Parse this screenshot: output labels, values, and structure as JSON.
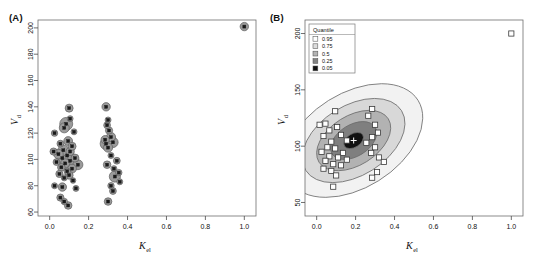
{
  "figure": {
    "panels": [
      {
        "id": "A",
        "label": "(A)",
        "xlabel_main": "K",
        "xlabel_sub": "el",
        "ylabel_main": "V",
        "ylabel_sub": "d",
        "xticks": [
          "0.0",
          "0.2",
          "0.4",
          "0.6",
          "0.8",
          "1.0"
        ],
        "yticks": [
          "60",
          "80",
          "100",
          "120",
          "140",
          "160",
          "180",
          "200"
        ]
      },
      {
        "id": "B",
        "label": "(B)",
        "xlabel_main": "K",
        "xlabel_sub": "el",
        "ylabel_main": "V",
        "ylabel_sub": "d",
        "xticks": [
          "0.0",
          "0.2",
          "0.4",
          "0.6",
          "0.8",
          "1.0"
        ],
        "yticks": [
          "50",
          "100",
          "150",
          "200"
        ],
        "legend": {
          "title": "Quantile",
          "items": [
            {
              "label": "0.95",
              "color": "#ffffff"
            },
            {
              "label": "0.75",
              "color": "#dcdcdc"
            },
            {
              "label": "0.5",
              "color": "#b4b4b4"
            },
            {
              "label": "0.25",
              "color": "#828282"
            },
            {
              "label": "0.05",
              "color": "#111111"
            }
          ]
        }
      }
    ]
  },
  "chart_data": [
    {
      "type": "scatter",
      "panel": "A",
      "title": "(A)",
      "xlabel": "K_el",
      "ylabel": "V_d",
      "xlim": [
        -0.06,
        1.06
      ],
      "ylim": [
        57,
        206
      ],
      "xticks": [
        0.0,
        0.2,
        0.4,
        0.6,
        0.8,
        1.0
      ],
      "yticks": [
        60,
        80,
        100,
        120,
        140,
        160,
        180,
        200
      ],
      "grid": false,
      "marker_note": "gray bubbles sized by weight, with small black squares at point centers",
      "points": [
        {
          "x": 0.1,
          "y": 139,
          "r": 4.0
        },
        {
          "x": 0.29,
          "y": 140,
          "r": 4.2
        },
        {
          "x": 0.105,
          "y": 131,
          "r": 3.0
        },
        {
          "x": 0.3,
          "y": 130,
          "r": 3.0
        },
        {
          "x": 0.085,
          "y": 127,
          "r": 6.5
        },
        {
          "x": 0.295,
          "y": 126,
          "r": 3.4
        },
        {
          "x": 0.075,
          "y": 124,
          "r": 5.0
        },
        {
          "x": 0.305,
          "y": 122,
          "r": 3.6
        },
        {
          "x": 0.025,
          "y": 120,
          "r": 3.2
        },
        {
          "x": 0.125,
          "y": 121,
          "r": 3.0
        },
        {
          "x": 0.315,
          "y": 117,
          "r": 4.6
        },
        {
          "x": 0.285,
          "y": 115,
          "r": 4.2
        },
        {
          "x": 0.095,
          "y": 114,
          "r": 4.4
        },
        {
          "x": 0.325,
          "y": 113,
          "r": 5.2
        },
        {
          "x": 0.055,
          "y": 112,
          "r": 3.4
        },
        {
          "x": 0.29,
          "y": 112,
          "r": 6.0
        },
        {
          "x": 0.115,
          "y": 110,
          "r": 4.0
        },
        {
          "x": 0.3,
          "y": 109,
          "r": 4.6
        },
        {
          "x": 0.02,
          "y": 106,
          "r": 3.6
        },
        {
          "x": 0.07,
          "y": 107,
          "r": 5.4
        },
        {
          "x": 0.105,
          "y": 106,
          "r": 4.2
        },
        {
          "x": 0.045,
          "y": 104,
          "r": 4.8
        },
        {
          "x": 0.09,
          "y": 103,
          "r": 6.8
        },
        {
          "x": 0.065,
          "y": 101,
          "r": 5.6
        },
        {
          "x": 0.13,
          "y": 101,
          "r": 4.0
        },
        {
          "x": 0.105,
          "y": 99,
          "r": 5.8
        },
        {
          "x": 0.035,
          "y": 98,
          "r": 3.4
        },
        {
          "x": 0.08,
          "y": 97,
          "r": 4.6
        },
        {
          "x": 0.145,
          "y": 96,
          "r": 5.0
        },
        {
          "x": 0.06,
          "y": 94,
          "r": 3.8
        },
        {
          "x": 0.115,
          "y": 93,
          "r": 4.4
        },
        {
          "x": 0.09,
          "y": 91,
          "r": 3.2
        },
        {
          "x": 0.05,
          "y": 89,
          "r": 3.6
        },
        {
          "x": 0.1,
          "y": 88,
          "r": 4.0
        },
        {
          "x": 0.075,
          "y": 86,
          "r": 3.0
        },
        {
          "x": 0.12,
          "y": 84,
          "r": 2.8
        },
        {
          "x": 0.025,
          "y": 80,
          "r": 3.0
        },
        {
          "x": 0.065,
          "y": 79,
          "r": 4.2
        },
        {
          "x": 0.135,
          "y": 78,
          "r": 3.0
        },
        {
          "x": 0.055,
          "y": 71,
          "r": 3.6
        },
        {
          "x": 0.075,
          "y": 68,
          "r": 3.2
        },
        {
          "x": 0.095,
          "y": 65,
          "r": 3.8
        },
        {
          "x": 0.315,
          "y": 103,
          "r": 3.0
        },
        {
          "x": 0.345,
          "y": 99,
          "r": 3.4
        },
        {
          "x": 0.295,
          "y": 96,
          "r": 3.8
        },
        {
          "x": 0.33,
          "y": 93,
          "r": 3.0
        },
        {
          "x": 0.355,
          "y": 90,
          "r": 3.2
        },
        {
          "x": 0.335,
          "y": 87,
          "r": 5.6
        },
        {
          "x": 0.36,
          "y": 83,
          "r": 3.0
        },
        {
          "x": 0.315,
          "y": 80,
          "r": 3.2
        },
        {
          "x": 0.325,
          "y": 76,
          "r": 3.4
        },
        {
          "x": 0.3,
          "y": 68,
          "r": 3.8
        },
        {
          "x": 1.0,
          "y": 201,
          "r": 4.2
        }
      ]
    },
    {
      "type": "scatter",
      "panel": "B",
      "title": "(B)",
      "xlabel": "K_el",
      "ylabel": "V_d",
      "xlim": [
        -0.06,
        1.06
      ],
      "ylim": [
        38,
        212
      ],
      "xticks": [
        0.0,
        0.2,
        0.4,
        0.6,
        0.8,
        1.0
      ],
      "yticks": [
        50,
        100,
        150,
        200
      ],
      "grid": false,
      "overlay": "nested bivariate quantile contour ellipses (0.05,0.25,0.5,0.75,0.95) centred at (0.19,105), major axis tilted ~30 deg",
      "center": {
        "x": 0.19,
        "y": 105
      },
      "contours": [
        {
          "quantile": 0.95,
          "rx": 0.39,
          "ry": 42,
          "fill": "#f2f2f2"
        },
        {
          "quantile": 0.75,
          "rx": 0.29,
          "ry": 31,
          "fill": "#d8d8d8"
        },
        {
          "quantile": 0.5,
          "rx": 0.21,
          "ry": 22,
          "fill": "#b2b2b2"
        },
        {
          "quantile": 0.25,
          "rx": 0.13,
          "ry": 14,
          "fill": "#7f7f7f"
        },
        {
          "quantile": 0.05,
          "rx": 0.055,
          "ry": 6,
          "fill": "#111111"
        }
      ],
      "points": [
        {
          "x": 0.095,
          "y": 131
        },
        {
          "x": 0.285,
          "y": 133
        },
        {
          "x": 0.265,
          "y": 127
        },
        {
          "x": 0.015,
          "y": 119
        },
        {
          "x": 0.045,
          "y": 120
        },
        {
          "x": 0.3,
          "y": 119
        },
        {
          "x": 0.065,
          "y": 114
        },
        {
          "x": 0.105,
          "y": 117
        },
        {
          "x": 0.315,
          "y": 112
        },
        {
          "x": 0.035,
          "y": 109
        },
        {
          "x": 0.125,
          "y": 110
        },
        {
          "x": 0.285,
          "y": 108
        },
        {
          "x": 0.075,
          "y": 104
        },
        {
          "x": 0.155,
          "y": 105
        },
        {
          "x": 0.255,
          "y": 103
        },
        {
          "x": 0.055,
          "y": 99
        },
        {
          "x": 0.095,
          "y": 98
        },
        {
          "x": 0.3,
          "y": 99
        },
        {
          "x": 0.025,
          "y": 95
        },
        {
          "x": 0.135,
          "y": 94
        },
        {
          "x": 0.28,
          "y": 94
        },
        {
          "x": 0.065,
          "y": 91
        },
        {
          "x": 0.11,
          "y": 90
        },
        {
          "x": 0.32,
          "y": 90
        },
        {
          "x": 0.045,
          "y": 87
        },
        {
          "x": 0.155,
          "y": 88
        },
        {
          "x": 0.345,
          "y": 86
        },
        {
          "x": 0.085,
          "y": 84
        },
        {
          "x": 0.125,
          "y": 83
        },
        {
          "x": 0.035,
          "y": 80
        },
        {
          "x": 0.075,
          "y": 78
        },
        {
          "x": 0.1,
          "y": 74
        },
        {
          "x": 0.31,
          "y": 77
        },
        {
          "x": 0.285,
          "y": 72
        },
        {
          "x": 0.085,
          "y": 64
        },
        {
          "x": 1.0,
          "y": 200
        }
      ]
    }
  ]
}
